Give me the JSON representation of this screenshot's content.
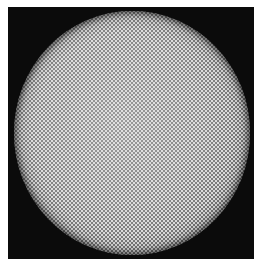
{
  "image": {
    "subject": "circular dot-pattern disc on black background",
    "colors": {
      "page_background": "#ffffff",
      "frame": "#0b0b0b",
      "disc_center": "#9a9a9a",
      "disc_edge": "#3a3a3a",
      "dots": "#ebebeb"
    }
  }
}
